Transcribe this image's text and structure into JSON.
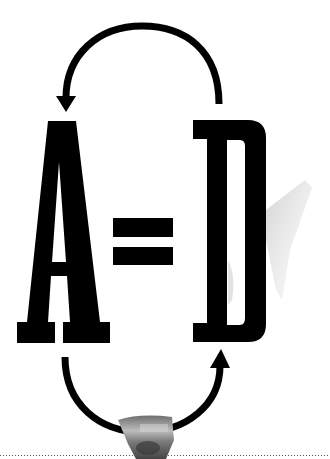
{
  "graphic": {
    "equation": {
      "left_letter": "A",
      "operator": "=",
      "right_letter": "D",
      "text": "A=D"
    },
    "arrows": [
      {
        "id": "top-arrow",
        "direction": "from D to A",
        "position": "top"
      },
      {
        "id": "bottom-arrow",
        "direction": "from A to D",
        "position": "bottom"
      }
    ],
    "photo_fragment": {
      "position": "bottom-center",
      "description": "torn grayscale photo fragment"
    },
    "footer_rule": {
      "style": "dotted"
    },
    "colors": {
      "background": "#ffffff",
      "ink": "#000000",
      "dotted_rule": "#555555",
      "photo_tone": "#8a8a8a"
    }
  }
}
